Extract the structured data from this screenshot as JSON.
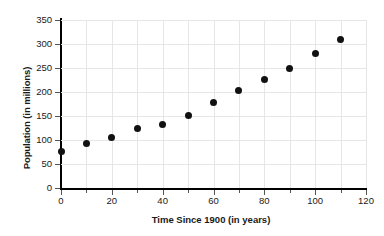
{
  "chart_data": {
    "type": "scatter",
    "title": "",
    "xlabel": "Time Since 1900 (in years)",
    "ylabel": "Population (in millions)",
    "xlim": [
      0,
      120
    ],
    "ylim": [
      0,
      350
    ],
    "grid": true,
    "legend": null,
    "x_major_ticks": [
      0,
      20,
      40,
      60,
      80,
      100,
      120
    ],
    "x_minor_ticks": [
      10,
      30,
      50,
      70,
      90,
      110
    ],
    "x_tick_labels": [
      "0",
      "20",
      "40",
      "60",
      "80",
      "100",
      "120"
    ],
    "y_ticks": [
      0,
      50,
      100,
      150,
      200,
      250,
      300,
      350
    ],
    "y_tick_labels": [
      "0",
      "50",
      "100",
      "150",
      "200",
      "250",
      "300",
      "350"
    ],
    "marker_color": "#111111",
    "grid_color": "#e6e6e6",
    "axis_color": "#000000",
    "x": [
      0,
      10,
      20,
      30,
      40,
      50,
      60,
      70,
      80,
      90,
      100,
      110
    ],
    "values": [
      76,
      92,
      106,
      123,
      132,
      151,
      179,
      203,
      227,
      249,
      281,
      309
    ],
    "points": [
      {
        "x": 0,
        "y": 76
      },
      {
        "x": 10,
        "y": 92
      },
      {
        "x": 20,
        "y": 106
      },
      {
        "x": 30,
        "y": 123
      },
      {
        "x": 40,
        "y": 132
      },
      {
        "x": 50,
        "y": 151
      },
      {
        "x": 60,
        "y": 179
      },
      {
        "x": 70,
        "y": 203
      },
      {
        "x": 80,
        "y": 227
      },
      {
        "x": 90,
        "y": 249
      },
      {
        "x": 100,
        "y": 281
      },
      {
        "x": 110,
        "y": 309
      }
    ]
  }
}
